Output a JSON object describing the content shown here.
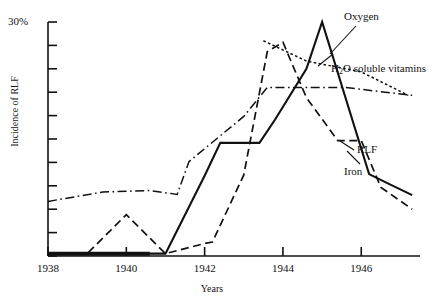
{
  "figure": {
    "title": "",
    "y_axis_label": "Incidence of RLF",
    "x_axis_label": "Years",
    "y_max_label": "30%"
  },
  "axis": {
    "x_tick_labels": [
      "1938",
      "1940",
      "1942",
      "1944",
      "1946"
    ],
    "y_tick_count": 11
  },
  "series_labels": {
    "oxygen": "Oxygen",
    "vitamins_pre": "H",
    "vitamins_sub": "2",
    "vitamins_post": "O soluble vitamins",
    "rlf": "RLF",
    "iron": "Iron"
  },
  "chart_data": {
    "type": "line",
    "title": "",
    "xlabel": "Years",
    "ylabel": "Incidence of RLF",
    "xlim": [
      1938,
      1947.5
    ],
    "ylim": [
      0,
      30
    ],
    "y_unit": "%",
    "ylim_labels": [
      "0",
      "30%"
    ],
    "grid": false,
    "legend_position": "inline-right-annotations",
    "x_tick_values": [
      1938,
      1940,
      1942,
      1944,
      1946
    ],
    "series": [
      {
        "name": "RLF",
        "style": "solid",
        "color": "#111111",
        "x": [
          1938.0,
          1941.0,
          1942.0,
          1942.4,
          1943.4,
          1943.8,
          1944.6,
          1945.0,
          1946.2,
          1946.6,
          1947.3
        ],
        "values": [
          0.3,
          0.3,
          10.3,
          14.5,
          14.5,
          17.5,
          24.0,
          30.0,
          10.5,
          9.5,
          7.8
        ]
      },
      {
        "name": "Iron",
        "style": "dashed",
        "color": "#111111",
        "x": [
          1938.4,
          1939.0,
          1940.0,
          1941.0,
          1942.0,
          1942.2,
          1943.0,
          1943.6,
          1944.0,
          1944.6,
          1945.4,
          1946.0,
          1946.5,
          1947.3
        ],
        "values": [
          0.3,
          0.3,
          5.3,
          0.3,
          1.6,
          1.8,
          10.4,
          26.2,
          27.4,
          20.3,
          14.8,
          14.8,
          8.8,
          6.0
        ]
      },
      {
        "name": "H2O soluble vitamins",
        "style": "dash-dot",
        "color": "#111111",
        "x": [
          1938.0,
          1939.4,
          1940.6,
          1941.3,
          1941.6,
          1943.0,
          1943.6,
          1944.3,
          1945.6,
          1947.3
        ],
        "values": [
          7.0,
          8.2,
          8.4,
          7.9,
          12.1,
          17.9,
          21.6,
          21.6,
          21.6,
          20.6
        ]
      },
      {
        "name": "Oxygen",
        "style": "dotted",
        "color": "#111111",
        "x": [
          1943.5,
          1944.6,
          1946.0,
          1947.2
        ],
        "values": [
          27.6,
          25.0,
          23.6,
          20.6
        ]
      }
    ],
    "annotations": [
      {
        "text": "Oxygen",
        "x": 1946.6,
        "y": 29.4
      },
      {
        "text": "H2O soluble vitamins",
        "x": 1946.4,
        "y": 23.0
      },
      {
        "text": "RLF",
        "x": 1947.6,
        "y": 12.9
      },
      {
        "text": "Iron",
        "x": 1947.2,
        "y": 10.4
      }
    ],
    "baseline_dark_segment": {
      "x": [
        1938.0,
        1940.6
      ],
      "y": 0.3
    }
  }
}
